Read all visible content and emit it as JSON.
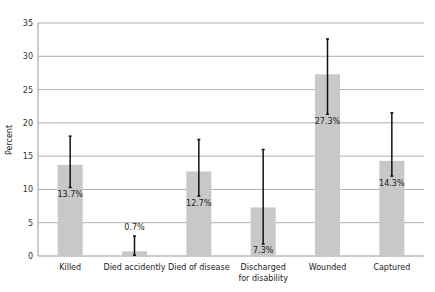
{
  "chart_data": {
    "type": "bar",
    "title": "",
    "xlabel": "",
    "ylabel": "Percent",
    "ylim": [
      0,
      35
    ],
    "yticks": [
      0,
      5,
      10,
      15,
      20,
      25,
      30,
      35
    ],
    "grid": true,
    "legend": null,
    "categories": [
      "Killed",
      "Died accidently",
      "Died of disease",
      "Discharged for disability",
      "Wounded",
      "Captured"
    ],
    "category_lines": [
      [
        "Killed"
      ],
      [
        "Died accidently"
      ],
      [
        "Died of disease"
      ],
      [
        "Discharged",
        "for disability"
      ],
      [
        "Wounded"
      ],
      [
        "Captured"
      ]
    ],
    "values": [
      13.7,
      0.7,
      12.7,
      7.3,
      27.3,
      14.3
    ],
    "value_labels": [
      "13.7%",
      "0.7%",
      "12.7%",
      "7.3%",
      "27.3%",
      "14.3%"
    ],
    "error_bars": [
      {
        "low": 10.3,
        "high": 18.0
      },
      {
        "low": 0.1,
        "high": 3.0
      },
      {
        "low": 9.0,
        "high": 17.5
      },
      {
        "low": 1.8,
        "high": 16.0
      },
      {
        "low": 21.3,
        "high": 32.6
      },
      {
        "low": 12.0,
        "high": 21.5
      }
    ],
    "label_positions": [
      "below_error_low",
      "above_error_high",
      "below_error_low",
      "below_error_low",
      "below_error_low",
      "below_error_low"
    ],
    "colors": {
      "bar": "#c8c8c8",
      "grid": "#b0b0b0",
      "error": "#111111",
      "axis": "#999999"
    }
  }
}
